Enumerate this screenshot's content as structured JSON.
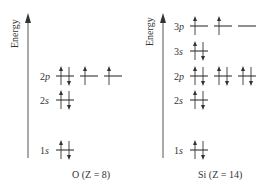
{
  "diagrams": [
    {
      "id": "oxygen",
      "axis_label": "Energy",
      "caption": "O (Z = 8)",
      "caption_element": "O",
      "caption_z": "(Z = 8)",
      "levels": [
        {
          "n": "2",
          "l": "p",
          "orbitals": [
            "up-down",
            "up",
            "up"
          ]
        },
        {
          "n": "2",
          "l": "s",
          "orbitals": [
            "up-down"
          ]
        },
        {
          "n": "1",
          "l": "s",
          "orbitals": [
            "up-down"
          ]
        }
      ]
    },
    {
      "id": "silicon",
      "axis_label": "Energy",
      "caption": "Si (Z = 14)",
      "caption_element": "Si",
      "caption_z": "(Z = 14)",
      "levels": [
        {
          "n": "3",
          "l": "p",
          "orbitals": [
            "up",
            "up",
            "empty"
          ]
        },
        {
          "n": "3",
          "l": "s",
          "orbitals": [
            "up-down"
          ]
        },
        {
          "n": "2",
          "l": "p",
          "orbitals": [
            "up-down",
            "up-down",
            "up-down"
          ]
        },
        {
          "n": "2",
          "l": "s",
          "orbitals": [
            "up-down"
          ]
        },
        {
          "n": "1",
          "l": "s",
          "orbitals": [
            "up-down"
          ]
        }
      ]
    }
  ],
  "colors": {
    "ink": "#333333",
    "axis": "#555555",
    "background": "#ffffff"
  }
}
